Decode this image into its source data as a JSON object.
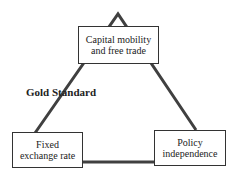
{
  "diagram": {
    "type": "impossible-trinity-triangle",
    "nodes": {
      "top": {
        "line1": "Capital mobility",
        "line2": "and free trade"
      },
      "left": {
        "line1": "Fixed",
        "line2": "exchange rate"
      },
      "right": {
        "line1": "Policy",
        "line2": "independence"
      }
    },
    "edge_labels": {
      "left_side": "Gold Standard"
    },
    "colors": {
      "line": "#404040",
      "box_border": "#333333",
      "text": "#222222"
    }
  }
}
